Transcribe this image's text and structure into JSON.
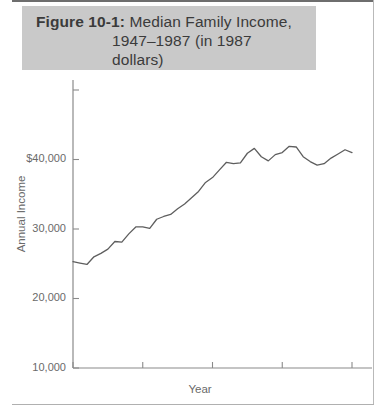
{
  "figure": {
    "label": "Figure 10-1:",
    "title_line1": "Median Family Income,",
    "title_line2": "1947–1987 (in 1987",
    "title_line3": "dollars)",
    "banner_color": "#c9c9c9"
  },
  "chart_data": {
    "type": "line",
    "title": "Median Family Income, 1947–1987 (in 1987 dollars)",
    "xlabel": "Year",
    "ylabel": "Annual Income",
    "xlim": [
      1947,
      1987
    ],
    "ylim": [
      0,
      40000
    ],
    "grid": false,
    "legend": "none",
    "line_color": "#5e5e5e",
    "axis_color": "#8a8a8a",
    "ytick_labels": [
      "$40,000",
      "30,000",
      "20,000",
      "10,000",
      "0"
    ],
    "ytick_values": [
      40000,
      30000,
      20000,
      10000,
      0
    ],
    "xtick_labels": [
      "1947",
      "1957",
      "1967",
      "1977",
      "1987"
    ],
    "xtick_values": [
      1947,
      1957,
      1967,
      1977,
      1987
    ],
    "x": [
      1947,
      1948,
      1949,
      1950,
      1951,
      1952,
      1953,
      1954,
      1955,
      1956,
      1957,
      1958,
      1959,
      1960,
      1961,
      1962,
      1963,
      1964,
      1965,
      1966,
      1967,
      1968,
      1969,
      1970,
      1971,
      1972,
      1973,
      1974,
      1975,
      1976,
      1977,
      1978,
      1979,
      1980,
      1981,
      1982,
      1983,
      1984,
      1985,
      1986,
      1987
    ],
    "values": [
      15300,
      15100,
      14900,
      16000,
      16500,
      17100,
      18200,
      18100,
      19300,
      20300,
      20300,
      20100,
      21400,
      21800,
      22100,
      22900,
      23600,
      24500,
      25400,
      26700,
      27400,
      28500,
      29600,
      29400,
      29500,
      30900,
      31600,
      30400,
      29800,
      30700,
      31000,
      31900,
      31800,
      30400,
      29700,
      29200,
      29400,
      30200,
      30800,
      31400,
      31000
    ]
  }
}
